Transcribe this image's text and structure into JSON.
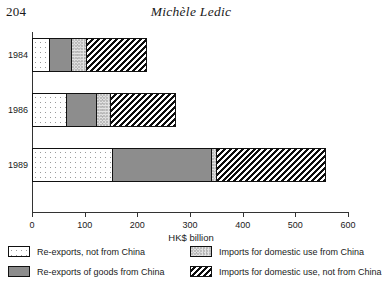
{
  "header": {
    "folio": "204",
    "title": "Michèle Ledic"
  },
  "chart_data": {
    "type": "bar",
    "orientation": "horizontal",
    "stacked": true,
    "title": "",
    "xlabel": "HK$ billion",
    "ylabel": "",
    "xlim": [
      0,
      600
    ],
    "xticks": [
      0,
      100,
      200,
      300,
      400,
      500,
      600
    ],
    "xtick_labels": [
      "0",
      "100",
      "200",
      "300",
      "400",
      "500",
      "600"
    ],
    "grid": false,
    "legend_position": "bottom",
    "categories": [
      "1984",
      "1986",
      "1989"
    ],
    "series": [
      {
        "name": "Re-exports, not from China",
        "pattern": "dots-sparse",
        "values": [
          30,
          64,
          150
        ]
      },
      {
        "name": "Re-exports of goods from China",
        "pattern": "solid-gray",
        "values": [
          42,
          57,
          190
        ]
      },
      {
        "name": "Imports for domestic use from China",
        "pattern": "dots-dense",
        "values": [
          30,
          26,
          9
        ]
      },
      {
        "name": "Imports for domestic use, not from China",
        "pattern": "hatch",
        "values": [
          114,
          124,
          207
        ]
      }
    ],
    "totals": [
      216,
      271,
      556
    ]
  },
  "legend": {
    "items": [
      "Re-exports, not from China",
      "Re-exports of goods from China",
      "Imports for domestic use from China",
      "Imports for domestic use, not from China"
    ]
  }
}
